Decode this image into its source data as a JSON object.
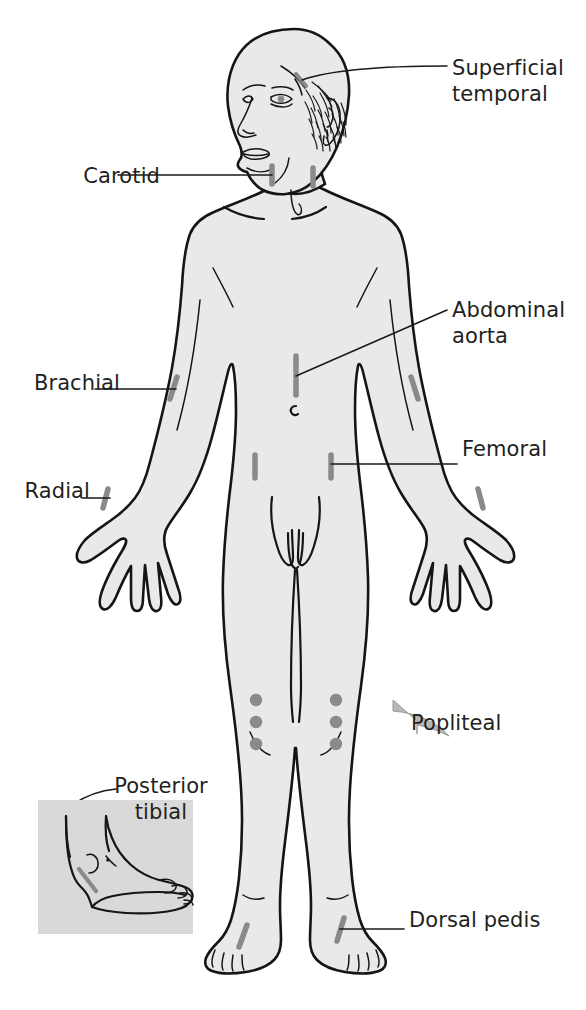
{
  "figure": {
    "background_color": "#ffffff",
    "skin_fill_color": "#e8e8e8",
    "outline_color": "#1a1a1a",
    "marker_color": "#8a8a8a",
    "label_color": "#231f20",
    "inset_background_color": "#d9d9d9"
  },
  "labels": {
    "superficial_temporal": "Superficial\ntemporal",
    "carotid": "Carotid",
    "abdominal_aorta": "Abdominal\naorta",
    "brachial": "Brachial",
    "femoral": "Femoral",
    "radial": "Radial",
    "popliteal": "Popliteal",
    "posterior_tibial": "Posterior\ntibial",
    "dorsal_pedis": "Dorsal pedis"
  },
  "pulse_points": [
    {
      "name": "superficial-temporal",
      "label": "Superficial temporal",
      "side": "right-of-figure",
      "marker": "line"
    },
    {
      "name": "carotid",
      "label": "Carotid",
      "side": "both",
      "marker": "line"
    },
    {
      "name": "abdominal-aorta",
      "label": "Abdominal aorta",
      "side": "midline",
      "marker": "line"
    },
    {
      "name": "brachial",
      "label": "Brachial",
      "side": "both",
      "marker": "line"
    },
    {
      "name": "femoral",
      "label": "Femoral",
      "side": "both",
      "marker": "line"
    },
    {
      "name": "radial",
      "label": "Radial",
      "side": "both",
      "marker": "line"
    },
    {
      "name": "popliteal",
      "label": "Popliteal",
      "side": "both",
      "marker": "three-dots"
    },
    {
      "name": "posterior-tibial",
      "label": "Posterior tibial",
      "side": "inset",
      "marker": "line"
    },
    {
      "name": "dorsal-pedis",
      "label": "Dorsal pedis",
      "side": "both",
      "marker": "line"
    }
  ],
  "inset": {
    "name": "posterior-tibial-inset",
    "description": "Medial view of a foot and ankle showing the posterior tibial pulse site"
  }
}
